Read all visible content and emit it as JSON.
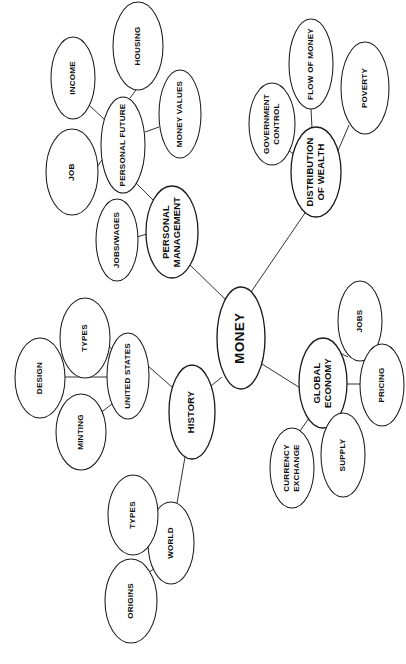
{
  "diagram": {
    "title": "MONEY",
    "type": "mind-map",
    "orientation": "text-rotated-90-clockwise",
    "background_color": "#ffffff",
    "line_color": "#1b1b1b",
    "text_color": "#0d0d0d",
    "central": {
      "id": "money",
      "label": "MONEY",
      "cx": 241,
      "cy": 338,
      "rx": 24,
      "ry": 51,
      "level": "central"
    },
    "nodes": [
      {
        "id": "personal-management",
        "label": "PERSONAL\nMANAGEMENT",
        "lines": [
          "PERSONAL",
          "MANAGEMENT"
        ],
        "cx": 172,
        "cy": 232,
        "rx": 26,
        "ry": 46,
        "level": "branch"
      },
      {
        "id": "distribution-of-wealth",
        "label": "DISTRIBUTION\nOF WEALTH",
        "lines": [
          "DISTRIBUTION",
          "OF WEALTH"
        ],
        "cx": 316,
        "cy": 172,
        "rx": 25,
        "ry": 45,
        "level": "branch"
      },
      {
        "id": "global-economy",
        "label": "GLOBAL\nECONOMY",
        "lines": [
          "GLOBAL",
          "ECONOMY"
        ],
        "cx": 323,
        "cy": 383,
        "rx": 24,
        "ry": 45,
        "level": "branch"
      },
      {
        "id": "history",
        "label": "HISTORY",
        "lines": [
          "HISTORY"
        ],
        "cx": 192,
        "cy": 412,
        "rx": 23,
        "ry": 47,
        "level": "branch"
      },
      {
        "id": "personal-future",
        "label": "PERSONAL FUTURE",
        "lines": [
          "PERSONAL FUTURE"
        ],
        "cx": 123,
        "cy": 145,
        "rx": 22,
        "ry": 48,
        "level": "sub"
      },
      {
        "id": "income",
        "label": "INCOME",
        "lines": [
          "INCOME"
        ],
        "cx": 73,
        "cy": 78,
        "rx": 22,
        "ry": 41,
        "level": "leaf"
      },
      {
        "id": "housing",
        "label": "HOUSING",
        "lines": [
          "HOUSING"
        ],
        "cx": 138,
        "cy": 46,
        "rx": 25,
        "ry": 44,
        "level": "leaf"
      },
      {
        "id": "money-values",
        "label": "MONEY VALUES",
        "lines": [
          "MONEY VALUES"
        ],
        "cx": 180,
        "cy": 114,
        "rx": 21,
        "ry": 44,
        "level": "leaf"
      },
      {
        "id": "job",
        "label": "JOB",
        "lines": [
          "JOB"
        ],
        "cx": 72,
        "cy": 172,
        "rx": 26,
        "ry": 43,
        "level": "leaf"
      },
      {
        "id": "jobs-wages",
        "label": "JOBS/WAGES",
        "lines": [
          "JOBS/WAGES"
        ],
        "cx": 117,
        "cy": 240,
        "rx": 21,
        "ry": 41,
        "level": "leaf"
      },
      {
        "id": "government-control",
        "label": "GOVERNMENT\nCONTROL",
        "lines": [
          "GOVERNMENT",
          "CONTROL"
        ],
        "cx": 272,
        "cy": 124,
        "rx": 23,
        "ry": 41,
        "level": "leaf"
      },
      {
        "id": "flow-of-money",
        "label": "FLOW OF MONEY",
        "lines": [
          "FLOW OF MONEY"
        ],
        "cx": 311,
        "cy": 64,
        "rx": 22,
        "ry": 45,
        "level": "leaf"
      },
      {
        "id": "poverty",
        "label": "POVERTY",
        "lines": [
          "POVERTY"
        ],
        "cx": 365,
        "cy": 88,
        "rx": 24,
        "ry": 46,
        "level": "leaf"
      },
      {
        "id": "jobs",
        "label": "JOBS",
        "lines": [
          "JOBS"
        ],
        "cx": 360,
        "cy": 321,
        "rx": 22,
        "ry": 40,
        "level": "leaf"
      },
      {
        "id": "pricing",
        "label": "PRICING",
        "lines": [
          "PRICING"
        ],
        "cx": 382,
        "cy": 385,
        "rx": 22,
        "ry": 41,
        "level": "leaf"
      },
      {
        "id": "supply",
        "label": "SUPPLY",
        "lines": [
          "SUPPLY"
        ],
        "cx": 343,
        "cy": 455,
        "rx": 22,
        "ry": 42,
        "level": "leaf"
      },
      {
        "id": "currency-exchange",
        "label": "CURRENCY\nEXCHANGE",
        "lines": [
          "CURRENCY",
          "EXCHANGE"
        ],
        "cx": 292,
        "cy": 468,
        "rx": 22,
        "ry": 40,
        "level": "leaf"
      },
      {
        "id": "united-states",
        "label": "UNITED STATES",
        "lines": [
          "UNITED STATES"
        ],
        "cx": 128,
        "cy": 376,
        "rx": 21,
        "ry": 43,
        "level": "sub"
      },
      {
        "id": "types-us",
        "label": "TYPES",
        "lines": [
          "TYPES"
        ],
        "cx": 85,
        "cy": 338,
        "rx": 25,
        "ry": 40,
        "level": "leaf"
      },
      {
        "id": "design",
        "label": "DESIGN",
        "lines": [
          "DESIGN"
        ],
        "cx": 40,
        "cy": 378,
        "rx": 25,
        "ry": 40,
        "level": "leaf"
      },
      {
        "id": "minting",
        "label": "MINTING",
        "lines": [
          "MINTING"
        ],
        "cx": 81,
        "cy": 432,
        "rx": 25,
        "ry": 38,
        "level": "leaf"
      },
      {
        "id": "world",
        "label": "WORLD",
        "lines": [
          "WORLD"
        ],
        "cx": 171,
        "cy": 543,
        "rx": 23,
        "ry": 41,
        "level": "sub"
      },
      {
        "id": "types-world",
        "label": "TYPES",
        "lines": [
          "TYPES"
        ],
        "cx": 133,
        "cy": 515,
        "rx": 25,
        "ry": 40,
        "level": "leaf"
      },
      {
        "id": "origins",
        "label": "ORIGINS",
        "lines": [
          "ORIGINS"
        ],
        "cx": 131,
        "cy": 601,
        "rx": 26,
        "ry": 42,
        "level": "leaf"
      }
    ],
    "edges": [
      {
        "from": "money",
        "to": "personal-management",
        "x1": 226,
        "y1": 300,
        "x2": 190,
        "y2": 265
      },
      {
        "from": "money",
        "to": "distribution-of-wealth",
        "x1": 249,
        "y1": 295,
        "x2": 305,
        "y2": 213
      },
      {
        "from": "money",
        "to": "global-economy",
        "x1": 262,
        "y1": 364,
        "x2": 305,
        "y2": 391
      },
      {
        "from": "money",
        "to": "history",
        "x1": 222,
        "y1": 377,
        "x2": 206,
        "y2": 390
      },
      {
        "from": "personal-management",
        "to": "personal-future",
        "x1": 158,
        "y1": 205,
        "x2": 136,
        "y2": 183
      },
      {
        "from": "personal-management",
        "to": "jobs-wages",
        "x1": 147,
        "y1": 234,
        "x2": 137,
        "y2": 237
      },
      {
        "from": "personal-future",
        "to": "income",
        "x1": 106,
        "y1": 121,
        "x2": 89,
        "y2": 105
      },
      {
        "from": "personal-future",
        "to": "housing",
        "x1": 130,
        "y1": 98,
        "x2": 136,
        "y2": 90
      },
      {
        "from": "personal-future",
        "to": "money-values",
        "x1": 145,
        "y1": 132,
        "x2": 159,
        "y2": 127
      },
      {
        "from": "personal-future",
        "to": "job",
        "x1": 102,
        "y1": 160,
        "x2": 97,
        "y2": 167
      },
      {
        "from": "distribution-of-wealth",
        "to": "government-control",
        "x1": 298,
        "y1": 157,
        "x2": 288,
        "y2": 150
      },
      {
        "from": "distribution-of-wealth",
        "to": "flow-of-money",
        "x1": 312,
        "y1": 128,
        "x2": 311,
        "y2": 109
      },
      {
        "from": "distribution-of-wealth",
        "to": "poverty",
        "x1": 337,
        "y1": 153,
        "x2": 349,
        "y2": 125
      },
      {
        "from": "global-economy",
        "to": "jobs",
        "x1": 334,
        "y1": 350,
        "x2": 348,
        "y2": 357
      },
      {
        "from": "global-economy",
        "to": "pricing",
        "x1": 347,
        "y1": 384,
        "x2": 360,
        "y2": 384
      },
      {
        "from": "global-economy",
        "to": "supply",
        "x1": 330,
        "y1": 424,
        "x2": 336,
        "y2": 414
      },
      {
        "from": "global-economy",
        "to": "currency-exchange",
        "x1": 309,
        "y1": 418,
        "x2": 300,
        "y2": 431
      },
      {
        "from": "history",
        "to": "united-states",
        "x1": 172,
        "y1": 387,
        "x2": 148,
        "y2": 366
      },
      {
        "from": "history",
        "to": "world",
        "x1": 185,
        "y1": 457,
        "x2": 177,
        "y2": 503
      },
      {
        "from": "united-states",
        "to": "types-us",
        "x1": 112,
        "y1": 349,
        "x2": 99,
        "y2": 338
      },
      {
        "from": "united-states",
        "to": "design",
        "x1": 107,
        "y1": 377,
        "x2": 65,
        "y2": 377
      },
      {
        "from": "united-states",
        "to": "minting",
        "x1": 112,
        "y1": 404,
        "x2": 99,
        "y2": 414
      },
      {
        "from": "world",
        "to": "types-world",
        "x1": 155,
        "y1": 527,
        "x2": 146,
        "y2": 539
      },
      {
        "from": "world",
        "to": "origins",
        "x1": 155,
        "y1": 568,
        "x2": 144,
        "y2": 576
      }
    ]
  }
}
